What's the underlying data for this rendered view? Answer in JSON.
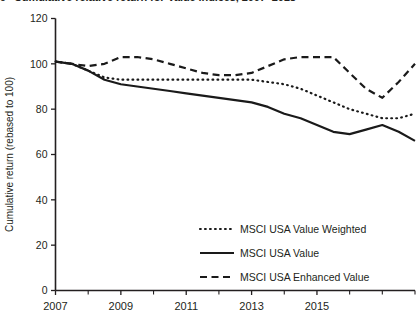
{
  "figure": {
    "number": "9",
    "title": "Cumulative relative return for Value indices, 2007–2018"
  },
  "axes": {
    "y_label": "Cumulative return (rebased to 100)",
    "y_ticks": [
      "0",
      "20",
      "40",
      "60",
      "80",
      "100",
      "120"
    ],
    "y_tick_values": [
      0,
      20,
      40,
      60,
      80,
      100,
      120
    ],
    "x_ticks": [
      "2007",
      "2009",
      "2011",
      "2013",
      "2015"
    ],
    "x_tick_values": [
      2007,
      2009,
      2011,
      2013,
      2015
    ],
    "x_minor_values": [
      2008,
      2010,
      2012,
      2014,
      2016,
      2017,
      2018
    ]
  },
  "legend": {
    "items": [
      {
        "label": "MSCI USA Value Weighted",
        "style": "dotted"
      },
      {
        "label": "MSCI USA Value",
        "style": "solid"
      },
      {
        "label": "MSCI USA Enhanced Value",
        "style": "dashed"
      }
    ]
  },
  "chart_data": {
    "type": "line",
    "title": "Cumulative relative return for Value indices, 2007–2018",
    "xlabel": "",
    "ylabel": "Cumulative return (rebased to 100)",
    "xlim": [
      2007,
      2018
    ],
    "ylim": [
      0,
      120
    ],
    "grid": false,
    "legend_position": "lower-right",
    "x": [
      2007,
      2007.5,
      2008,
      2008.5,
      2009,
      2009.5,
      2010,
      2010.5,
      2011,
      2011.5,
      2012,
      2012.5,
      2013,
      2013.5,
      2014,
      2014.5,
      2015,
      2015.5,
      2016,
      2016.5,
      2017,
      2017.5,
      2018
    ],
    "series": [
      {
        "name": "MSCI USA Value Weighted",
        "style": "dotted",
        "values": [
          101,
          100,
          97,
          94,
          93,
          93,
          93,
          93,
          93,
          93,
          93,
          93,
          93,
          92,
          91,
          89,
          86,
          83,
          80,
          78,
          76,
          76,
          78
        ]
      },
      {
        "name": "MSCI USA Value",
        "style": "solid",
        "values": [
          101,
          100,
          97,
          93,
          91,
          90,
          89,
          88,
          87,
          86,
          85,
          84,
          83,
          81,
          78,
          76,
          73,
          70,
          69,
          71,
          73,
          70,
          66
        ]
      },
      {
        "name": "MSCI USA Enhanced Value",
        "style": "dashed",
        "values": [
          101,
          100,
          99,
          100,
          103,
          103,
          102,
          100,
          98,
          96,
          95,
          95,
          96,
          99,
          102,
          103,
          103,
          103,
          96,
          89,
          85,
          92,
          100
        ]
      }
    ]
  }
}
